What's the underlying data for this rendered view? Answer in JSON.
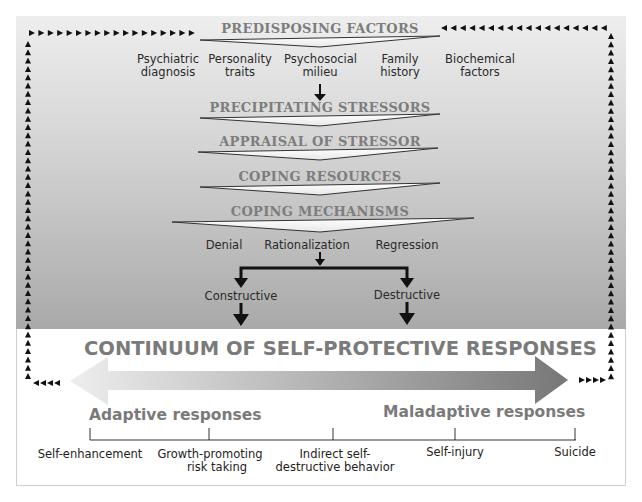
{
  "predisposing": {
    "title": "PREDISPOSING FACTORS",
    "factors": [
      {
        "line1": "Psychiatric",
        "line2": "diagnosis"
      },
      {
        "line1": "Personality",
        "line2": "traits"
      },
      {
        "line1": "Psychosocial",
        "line2": "milieu"
      },
      {
        "line1": "Family",
        "line2": "history"
      },
      {
        "line1": "Biochemical",
        "line2": "factors"
      }
    ]
  },
  "stages": [
    "PRECIPITATING STRESSORS",
    "APPRAISAL OF STRESSOR",
    "COPING RESOURCES",
    "COPING MECHANISMS"
  ],
  "mechanisms": [
    "Denial",
    "Rationalization",
    "Regression"
  ],
  "branches": [
    "Constructive",
    "Destructive"
  ],
  "continuum": {
    "title": "CONTINUUM OF SELF-PROTECTIVE RESPONSES",
    "left_label": "Adaptive responses",
    "right_label": "Maladaptive responses",
    "points": [
      {
        "line1": "Self-enhancement",
        "line2": ""
      },
      {
        "line1": "Growth-promoting",
        "line2": "risk taking"
      },
      {
        "line1": "Indirect self-",
        "line2": "destructive behavior"
      },
      {
        "line1": "Self-injury",
        "line2": ""
      },
      {
        "line1": "Suicide",
        "line2": ""
      }
    ]
  },
  "colors": {
    "header_text": "#7d7d7d",
    "body_text": "#222222",
    "arrow_light": "#e6e6e6",
    "arrow_dark": "#7a7a7a"
  }
}
